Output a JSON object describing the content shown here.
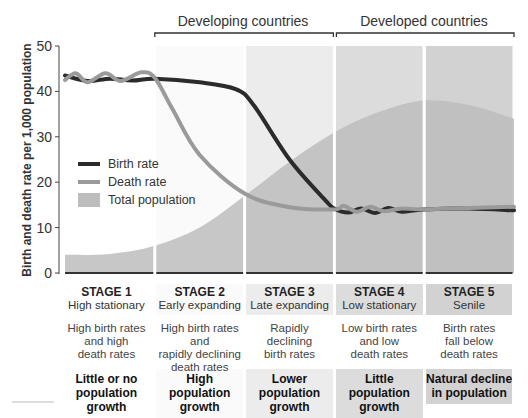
{
  "chart_data": {
    "type": "line",
    "title": "",
    "ylabel": "Birth and death rate per 1,000 population",
    "xlabel": "",
    "ylim": [
      0,
      50
    ],
    "yticks": [
      0,
      10,
      20,
      30,
      40,
      50
    ],
    "grid": false,
    "legend_position": "middle-left",
    "x_domain": [
      0,
      5
    ],
    "series": [
      {
        "name": "Birth rate",
        "color": "#2b2b2b",
        "points": [
          [
            0,
            43.5
          ],
          [
            0.25,
            42.3
          ],
          [
            0.5,
            42.8
          ],
          [
            0.75,
            42.4
          ],
          [
            1.0,
            42.8
          ],
          [
            1.5,
            42.0
          ],
          [
            1.9,
            40.5
          ],
          [
            2.1,
            37.0
          ],
          [
            2.5,
            25.0
          ],
          [
            2.9,
            16.0
          ],
          [
            3.0,
            14.2
          ],
          [
            3.15,
            13.3
          ],
          [
            3.3,
            14.2
          ],
          [
            3.45,
            13.2
          ],
          [
            3.6,
            14.3
          ],
          [
            3.75,
            13.5
          ],
          [
            4.0,
            14.0
          ],
          [
            4.5,
            14.2
          ],
          [
            5.0,
            13.8
          ]
        ]
      },
      {
        "name": "Death rate",
        "color": "#9a9a9a",
        "points": [
          [
            0,
            42.5
          ],
          [
            0.12,
            44.0
          ],
          [
            0.25,
            42.0
          ],
          [
            0.45,
            44.0
          ],
          [
            0.62,
            42.3
          ],
          [
            0.85,
            44.2
          ],
          [
            1.0,
            43.0
          ],
          [
            1.2,
            36.0
          ],
          [
            1.5,
            26.0
          ],
          [
            2.0,
            17.5
          ],
          [
            2.5,
            14.5
          ],
          [
            3.0,
            14.0
          ],
          [
            3.1,
            14.8
          ],
          [
            3.25,
            13.5
          ],
          [
            3.4,
            14.6
          ],
          [
            3.55,
            13.6
          ],
          [
            3.75,
            14.2
          ],
          [
            4.0,
            14.0
          ],
          [
            4.5,
            14.3
          ],
          [
            5.0,
            14.6
          ]
        ]
      },
      {
        "name": "Total population",
        "type": "area",
        "color": "#bdbdbd",
        "points": [
          [
            0,
            4.0
          ],
          [
            0.5,
            4.2
          ],
          [
            1.0,
            6.0
          ],
          [
            1.5,
            10.0
          ],
          [
            2.0,
            17.0
          ],
          [
            2.5,
            24.5
          ],
          [
            3.0,
            31.0
          ],
          [
            3.5,
            35.5
          ],
          [
            4.0,
            38.0
          ],
          [
            4.5,
            37.0
          ],
          [
            5.0,
            34.0
          ]
        ]
      }
    ],
    "regions": [
      {
        "label": "Developing countries",
        "from_stage": 2,
        "to_stage": 3
      },
      {
        "label": "Developed countries",
        "from_stage": 4,
        "to_stage": 5
      }
    ],
    "stage_backgrounds": [
      "#ffffff",
      "#fafafa",
      "#ececec",
      "#dcdcdc",
      "#d2d2d2"
    ]
  },
  "legend": [
    {
      "label": "Birth rate",
      "color": "#2b2b2b",
      "kind": "line"
    },
    {
      "label": "Death rate",
      "color": "#9a9a9a",
      "kind": "line"
    },
    {
      "label": "Total population",
      "color": "#bdbdbd",
      "kind": "area"
    }
  ],
  "stages": [
    {
      "title": "STAGE 1",
      "subtitle": "High stationary",
      "desc": [
        "High birth rates",
        "and high",
        "death rates"
      ],
      "growth": [
        "Little or no",
        "population growth"
      ],
      "bg": "#ffffff"
    },
    {
      "title": "STAGE 2",
      "subtitle": "Early expanding",
      "desc": [
        "High birth rates and",
        "rapidly declining",
        "death rates"
      ],
      "growth": [
        "High",
        "population growth"
      ],
      "bg": "#fafafa"
    },
    {
      "title": "STAGE 3",
      "subtitle": "Late expanding",
      "desc": [
        "Rapidly",
        "declining",
        "birth rates"
      ],
      "growth": [
        "Lower",
        "population growth"
      ],
      "bg": "#ececec"
    },
    {
      "title": "STAGE 4",
      "subtitle": "Low stationary",
      "desc": [
        "Low birth rates",
        "and low",
        "death rates"
      ],
      "growth": [
        "Little",
        "population growth"
      ],
      "bg": "#dcdcdc"
    },
    {
      "title": "STAGE 5",
      "subtitle": "Senile",
      "desc": [
        "Birth rates",
        "fall below",
        "death rates"
      ],
      "growth": [
        "Natural decline",
        "in population"
      ],
      "bg": "#d2d2d2"
    }
  ]
}
